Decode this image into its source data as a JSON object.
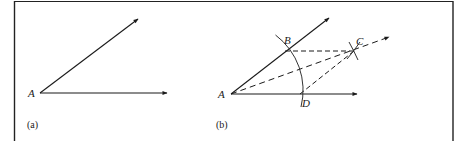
{
  "figure": {
    "frame": {
      "left": 14,
      "right": 453,
      "top": 1
    },
    "colors": {
      "stroke": "#1a1a1a",
      "frame": "#222222",
      "background": "#ffffff"
    },
    "panels": [
      {
        "id": "a",
        "label": "(a)",
        "points": [
          {
            "name": "A",
            "label": "A",
            "x": 40,
            "y": 93
          }
        ],
        "rays": [
          {
            "from": [
              40,
              93
            ],
            "to": [
              138,
              19
            ],
            "style": "solid",
            "arrow": true
          },
          {
            "from": [
              40,
              93
            ],
            "to": [
              167,
              93
            ],
            "style": "solid",
            "arrow": true
          }
        ]
      },
      {
        "id": "b",
        "label": "(b)",
        "points": [
          {
            "name": "A",
            "label": "A",
            "x": 231,
            "y": 94
          },
          {
            "name": "B",
            "label": "B",
            "x": 285,
            "y": 51
          },
          {
            "name": "C",
            "label": "C",
            "x": 354,
            "y": 51
          },
          {
            "name": "D",
            "label": "D",
            "x": 300,
            "y": 94
          }
        ],
        "rays": [
          {
            "from": [
              231,
              94
            ],
            "to": [
              329,
              18
            ],
            "style": "solid",
            "arrow": true
          },
          {
            "from": [
              231,
              94
            ],
            "to": [
              357,
              94
            ],
            "style": "solid",
            "arrow": true
          },
          {
            "from": [
              231,
              94
            ],
            "to": [
              389,
              37
            ],
            "style": "dashed",
            "arrow": true
          }
        ],
        "segments": [
          {
            "from": "B",
            "to": "C",
            "style": "dashed"
          },
          {
            "from": "D",
            "to": "C",
            "style": "dashed"
          }
        ],
        "arc": {
          "center": "A",
          "through": [
            "B",
            "D"
          ]
        },
        "intersection_marks": [
          "C"
        ]
      }
    ]
  }
}
